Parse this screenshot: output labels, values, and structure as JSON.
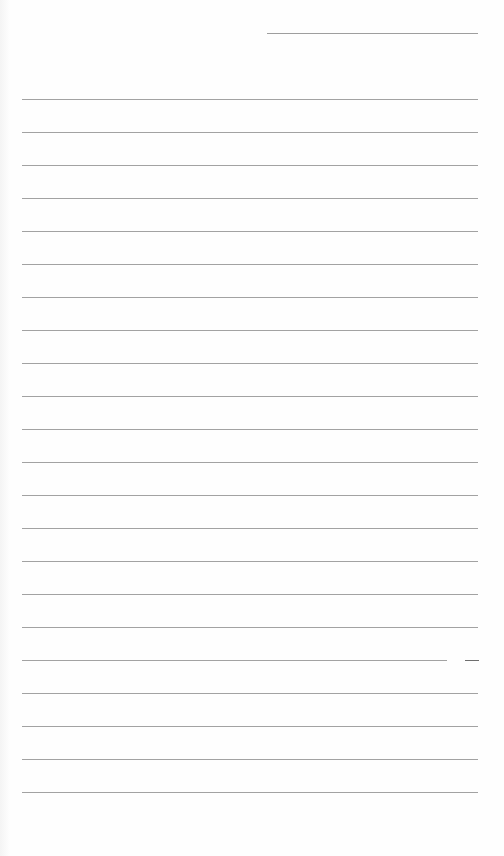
{
  "document": {
    "type": "lined-paper",
    "background_color": "#fefefe",
    "line_color": "#a2a2a2",
    "header": {
      "bleed_through_text": "",
      "name_line": {
        "x": 267,
        "y": 33,
        "width": 211
      }
    },
    "ruled_lines": {
      "count": 22,
      "first_y": 99,
      "spacing": 33,
      "x": 22,
      "width": 456
    },
    "gapped_line": {
      "index": 17,
      "segments": [
        {
          "x": 22,
          "width": 425,
          "color": "#a2a2a2"
        },
        {
          "x": 465,
          "width": 14,
          "color": "#6e6e6e"
        }
      ]
    }
  }
}
